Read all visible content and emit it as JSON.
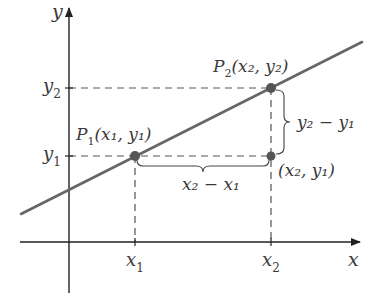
{
  "diagram": {
    "colors": {
      "axis": "#222222",
      "line": "#666666",
      "dash": "#555555",
      "point": "#555555",
      "text": "#3a3a3a"
    },
    "axes": {
      "x_label": "x",
      "y_label": "y"
    },
    "ticks": {
      "x1": {
        "base": "x",
        "sub": "1"
      },
      "x2": {
        "base": "x",
        "sub": "2"
      },
      "y1": {
        "base": "y",
        "sub": "1"
      },
      "y2": {
        "base": "y",
        "sub": "2"
      }
    },
    "points": {
      "p1": {
        "name": "P",
        "name_sub": "1",
        "coord_text": "(x₁, y₁)"
      },
      "p2": {
        "name": "P",
        "name_sub": "2",
        "coord_text": "(x₂, y₂)"
      },
      "corner": {
        "coord_text": "(x₂, y₁)"
      }
    },
    "braces": {
      "horizontal": {
        "expression": "x₂ − x₁"
      },
      "vertical": {
        "expression": "y₂ − y₁"
      }
    }
  }
}
